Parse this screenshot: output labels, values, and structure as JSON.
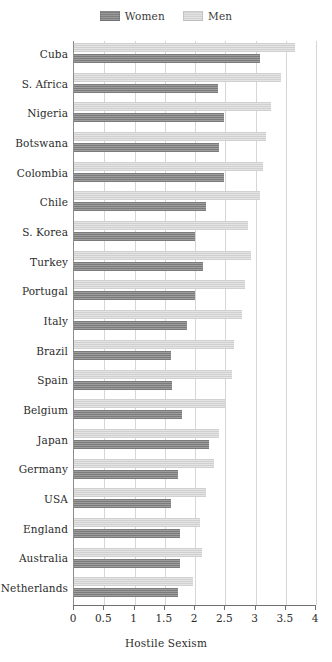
{
  "chart_data": {
    "type": "bar",
    "orientation": "horizontal",
    "title": "",
    "xlabel": "Hostile Sexism",
    "ylabel": "",
    "xlim": [
      0,
      4
    ],
    "xticks": [
      "0",
      "0.5",
      "1",
      "1.5",
      "2",
      "2.5",
      "3",
      "3.5",
      "4"
    ],
    "xtick_values": [
      0,
      0.5,
      1,
      1.5,
      2,
      2.5,
      3,
      3.5,
      4
    ],
    "grid": true,
    "legend_position": "top-center",
    "categories": [
      "Cuba",
      "S. Africa",
      "Nigeria",
      "Botswana",
      "Colombia",
      "Chile",
      "S. Korea",
      "Turkey",
      "Portugal",
      "Italy",
      "Brazil",
      "Spain",
      "Belgium",
      "Japan",
      "Germany",
      "USA",
      "England",
      "Australia",
      "Netherlands"
    ],
    "series": [
      {
        "name": "Women",
        "color": "#8b8b8b",
        "values": [
          3.08,
          2.38,
          2.48,
          2.4,
          2.48,
          2.18,
          2.0,
          2.13,
          2.0,
          1.86,
          1.61,
          1.62,
          1.78,
          2.23,
          1.72,
          1.61,
          1.75,
          1.75,
          1.72
        ]
      },
      {
        "name": "Men",
        "color": "#dbdbdb",
        "values": [
          3.65,
          3.42,
          3.25,
          3.17,
          3.12,
          3.07,
          2.87,
          2.93,
          2.83,
          2.77,
          2.64,
          2.61,
          2.49,
          2.4,
          2.32,
          2.19,
          2.08,
          2.11,
          1.97
        ]
      }
    ]
  },
  "legend": {
    "entries": [
      {
        "label": "Women",
        "swatch": "women-swatch"
      },
      {
        "label": "Men",
        "swatch": "men-swatch"
      }
    ]
  }
}
